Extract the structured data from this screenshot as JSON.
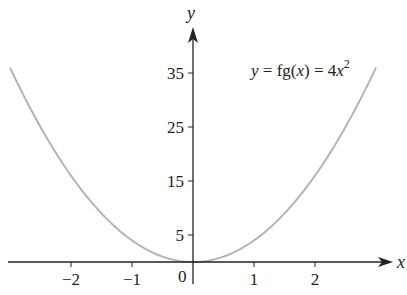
{
  "chart_data": {
    "type": "line",
    "title": "",
    "xlabel": "x",
    "ylabel": "y",
    "equation_label": {
      "prefix_var": "y",
      "middle": " = fg(",
      "arg": "x",
      "suffix": ") = 4",
      "power_var": "x",
      "exponent": "2"
    },
    "x_ticks": [
      -2,
      -1,
      1,
      2
    ],
    "x_tick_labels": [
      "−2",
      "−1",
      "1",
      "2"
    ],
    "origin_label": "0",
    "y_ticks": [
      5,
      15,
      25,
      35
    ],
    "y_tick_labels": [
      "5",
      "15",
      "25",
      "35"
    ],
    "xlim": [
      -3.15,
      3.3
    ],
    "ylim": [
      0,
      40
    ],
    "grid": false,
    "series": [
      {
        "name": "y = fg(x) = 4x^2",
        "function": "4x^2",
        "x": [
          -3,
          -2.5,
          -2,
          -1.5,
          -1,
          -0.5,
          0,
          0.5,
          1,
          1.5,
          2,
          2.5,
          3
        ],
        "values": [
          36,
          25,
          16,
          9,
          4,
          1,
          0,
          1,
          4,
          9,
          16,
          25,
          36
        ],
        "color": "#b4b4b4"
      }
    ]
  },
  "colors": {
    "axis": "#222222",
    "curve": "#b4b4b4",
    "background": "#ffffff"
  }
}
